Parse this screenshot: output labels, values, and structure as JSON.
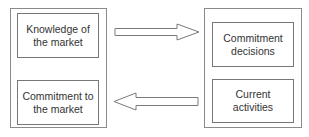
{
  "diagram": {
    "left_panel": {
      "top_box": {
        "line1": "Knowledge of",
        "line2": "the market"
      },
      "bottom_box": {
        "line1": "Commitment to",
        "line2": "the market"
      }
    },
    "right_panel": {
      "top_box": {
        "line1": "Commitment",
        "line2": "decisions"
      },
      "bottom_box": {
        "line1": "Current",
        "line2": "activities"
      }
    },
    "arrows": [
      {
        "from": "left_panel",
        "to": "right_panel",
        "direction": "right"
      },
      {
        "from": "right_panel",
        "to": "left_panel",
        "direction": "left"
      }
    ],
    "colors": {
      "stroke": "#777777",
      "text": "#333333",
      "background": "#ffffff"
    }
  }
}
